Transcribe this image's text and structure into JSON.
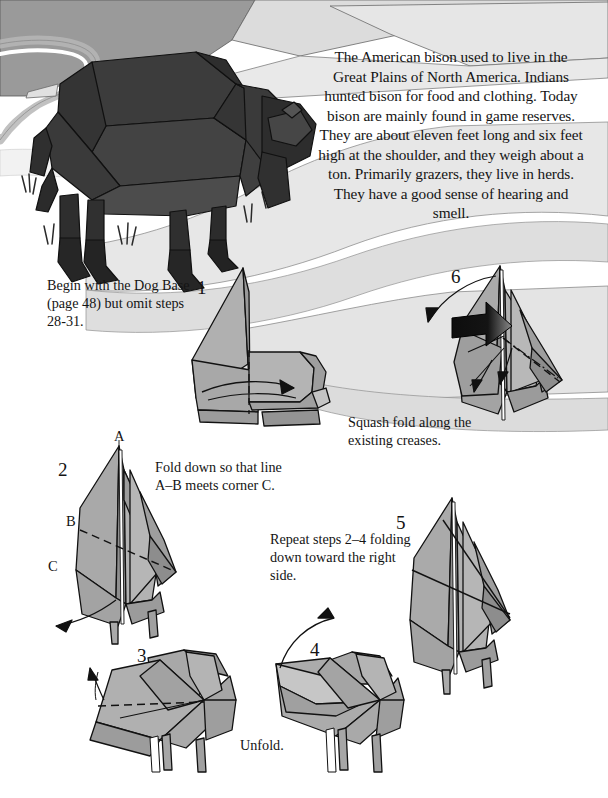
{
  "page": {
    "width": 608,
    "height": 798,
    "background": "#ffffff"
  },
  "colors": {
    "paper_front": "#a8a8a8",
    "paper_back": "#c9c9c9",
    "paper_shade": "#8f8f8f",
    "model_dark": "#3a3a3a",
    "model_darker": "#2a2a2a",
    "line": "#1a1a1a",
    "landscape_light": "#e2e2e2",
    "landscape_mid": "#d2d2d2",
    "landscape_dark": "#9a9a9a",
    "text": "#141414"
  },
  "intro": {
    "text": "The American bison used to live in the Great Plains of North America. Indians hunted bison for food and clothing. Today bison are mainly found in game reserves. They are about eleven feet long and six feet high at the shoulder, and they weigh about a ton. Primarily grazers, they live in herds. They have a good sense of hearing and smell."
  },
  "illustration": {
    "name": "folded-bison-figure",
    "description": "Completed dark gray origami bison standing on a plain with a winding pale river and grass tufts"
  },
  "steps": [
    {
      "number": "1",
      "caption": "Begin with the Dog Base (page 48) but omit steps 28-31.",
      "diagram": "step-1-diagram"
    },
    {
      "number": "2",
      "caption": "Fold down so that line A–B meets corner C.",
      "diagram": "step-2-diagram",
      "labels": [
        "A",
        "B",
        "C"
      ]
    },
    {
      "number": "3",
      "caption": "",
      "diagram": "step-3-diagram"
    },
    {
      "number": "4",
      "caption": "Unfold.",
      "diagram": "step-4-diagram"
    },
    {
      "number": "5",
      "caption": "Repeat steps 2–4 folding down toward the right side.",
      "diagram": "step-5-diagram"
    },
    {
      "number": "6",
      "caption": "Squash fold along the existing creases.",
      "diagram": "step-6-diagram"
    }
  ],
  "labels": {
    "a": "A",
    "b": "B",
    "c": "C"
  }
}
